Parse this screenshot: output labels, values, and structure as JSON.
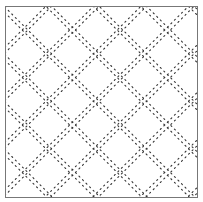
{
  "pattern": {
    "type": "dotted-diamond-lattice",
    "frame": {
      "x": 5,
      "y": 6,
      "width": 192,
      "height": 191,
      "stroke": "#777777"
    },
    "dot_color": "#333333",
    "background": "#ffffff",
    "period": 47.5,
    "rising_offset": 5,
    "falling_offset": 55,
    "band_gap": 4,
    "dot_spacing": 5
  }
}
